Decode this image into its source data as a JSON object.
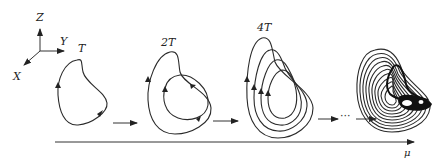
{
  "diagram": {
    "type": "period-doubling route to chaos",
    "axes_3d": {
      "x_label": "X",
      "y_label": "Y",
      "z_label": "Z"
    },
    "stages": [
      {
        "label": "T",
        "loops": 1
      },
      {
        "label": "2T",
        "loops": 2
      },
      {
        "label": "4T",
        "loops": 4
      },
      {
        "label": "",
        "loops": "chaotic attractor"
      }
    ],
    "ellipsis": "···",
    "parameter_axis": {
      "label": "μ"
    },
    "colors": {
      "line": "#2a2a2a",
      "background": "#ffffff"
    }
  }
}
